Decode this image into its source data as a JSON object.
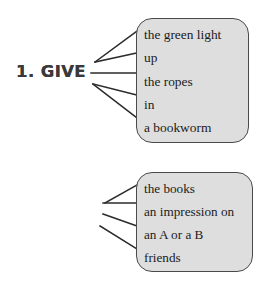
{
  "exercise": {
    "colors": {
      "box_fill": "#dedede",
      "box_border": "#4a4a4a",
      "verb_text": "#3a3a3a",
      "phrase_text": "#1b1b1b",
      "line": "#2b2b2b",
      "page_background": "#ffffff"
    },
    "groups": [
      {
        "number": "1.",
        "verb": "GIVE",
        "label": "1. GIVE",
        "phrases": [
          "the green light",
          "up",
          "the ropes",
          "in",
          "a bookworm"
        ]
      },
      {
        "number": "2.",
        "verb": "MAKE",
        "label": "2. MAKE",
        "phrases": [
          "the books",
          "an impression on",
          "an A or a B",
          "friends"
        ]
      }
    ]
  }
}
